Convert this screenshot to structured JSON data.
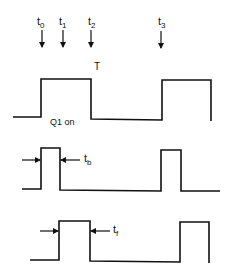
{
  "diagram": {
    "type": "timing-diagram",
    "time_markers": [
      {
        "label": "t",
        "sub": "0",
        "x": 42
      },
      {
        "label": "t",
        "sub": "1",
        "x": 63
      },
      {
        "label": "t",
        "sub": "2",
        "x": 91
      },
      {
        "label": "t",
        "sub": "3",
        "x": 161
      }
    ],
    "period_label": "T",
    "waveform1": {
      "annotation": "Q1 on"
    },
    "waveform2": {
      "interval_label": "t",
      "interval_sub": "b"
    },
    "waveform3": {
      "interval_label": "t",
      "interval_sub": "f"
    },
    "colors": {
      "line": "#111111",
      "background": "#ffffff"
    }
  }
}
